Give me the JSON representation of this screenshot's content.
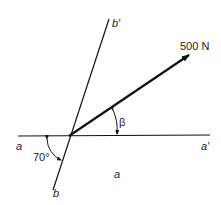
{
  "diagram": {
    "force_label": "500 N",
    "angle_beta_label": "β",
    "angle_70_label": "70°",
    "line_a_start": "a",
    "line_a_end": "a′",
    "line_b_start": "b",
    "line_b_end": "b′",
    "region_label": "a",
    "colors": {
      "stroke": "#111111",
      "text": "#222222"
    }
  }
}
